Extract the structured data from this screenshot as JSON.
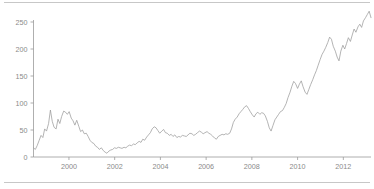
{
  "figure": {
    "background_color": "#ffffff",
    "width": 374,
    "height": 189,
    "top_rule_color": "#b9b9b9",
    "bottom_rule_color": "#b9b9b9"
  },
  "chart_data": {
    "type": "line",
    "title": "",
    "subtitle": "",
    "xlabel": "",
    "ylabel": "",
    "xlim": [
      1998.4,
      1998.4
    ],
    "ylim": [
      0,
      275
    ],
    "grid": false,
    "legend": null,
    "legend_position": "none",
    "axis_color": "#9a9a9a",
    "line_color": "#9b9b9b",
    "line_width": 0.75,
    "yticks": [
      0,
      50,
      100,
      150,
      200,
      250
    ],
    "ytick_labels": [
      "0",
      "50",
      "100",
      "150",
      "200",
      "250"
    ],
    "xticks": [
      2000,
      2002,
      2004,
      2006,
      2008,
      2010,
      2012
    ],
    "xtick_labels": [
      "2000",
      "2002",
      "2004",
      "2006",
      "2008",
      "2010",
      "2012"
    ],
    "x_start": 1998.45,
    "x_end": 1998.45,
    "series": [
      {
        "name": "value",
        "x": [
          1998.45,
          1998.53,
          1998.61,
          1998.69,
          1998.78,
          1998.86,
          1998.94,
          1999.02,
          1999.11,
          1999.19,
          1999.27,
          1999.35,
          1999.44,
          1999.52,
          1999.6,
          1999.68,
          1999.77,
          1999.85,
          1999.93,
          2000.01,
          2000.1,
          2000.18,
          2000.26,
          2000.34,
          2000.43,
          2000.51,
          2000.59,
          2000.67,
          2000.76,
          2000.84,
          2000.92,
          2001.0,
          2001.09,
          2001.17,
          2001.25,
          2001.33,
          2001.42,
          2001.5,
          2001.58,
          2001.66,
          2001.75,
          2001.83,
          2001.91,
          2001.99,
          2002.08,
          2002.16,
          2002.24,
          2002.32,
          2002.41,
          2002.49,
          2002.57,
          2002.65,
          2002.74,
          2002.82,
          2002.9,
          2002.98,
          2003.07,
          2003.15,
          2003.23,
          2003.31,
          2003.4,
          2003.48,
          2003.56,
          2003.64,
          2003.73,
          2003.81,
          2003.89,
          2003.97,
          2004.06,
          2004.14,
          2004.22,
          2004.3,
          2004.39,
          2004.47,
          2004.55,
          2004.63,
          2004.72,
          2004.8,
          2004.88,
          2004.96,
          2005.05,
          2005.13,
          2005.21,
          2005.29,
          2005.38,
          2005.46,
          2005.54,
          2005.62,
          2005.71,
          2005.79,
          2005.87,
          2005.95,
          2006.04,
          2006.12,
          2006.2,
          2006.28,
          2006.37,
          2006.45,
          2006.53,
          2006.61,
          2006.7,
          2006.78,
          2006.86,
          2006.94,
          2007.03,
          2007.11,
          2007.19,
          2007.27,
          2007.36,
          2007.44,
          2007.52,
          2007.6,
          2007.69,
          2007.77,
          2007.85,
          2007.93,
          2008.02,
          2008.1,
          2008.18,
          2008.26,
          2008.35,
          2008.43,
          2008.51,
          2008.59,
          2008.68,
          2008.76,
          2008.84,
          2008.92,
          2009.01,
          2009.09,
          2009.17,
          2009.25,
          2009.34,
          2009.42,
          2009.5,
          2009.58,
          2009.67,
          2009.75,
          2009.83,
          2009.91,
          2010.0,
          2010.08,
          2010.16,
          2010.24,
          2010.33,
          2010.41,
          2010.49,
          2010.57,
          2010.66,
          2010.74,
          2010.82,
          2010.9,
          2010.99,
          2011.07,
          2011.15,
          2011.23,
          2011.32,
          2011.4,
          2011.48,
          2011.56,
          2011.65,
          2011.73,
          2011.81,
          2011.89,
          2011.98,
          2012.06,
          2012.14,
          2012.22,
          2012.31,
          2012.39,
          2012.47,
          2012.55,
          2012.64,
          2012.72,
          2012.8,
          2012.88,
          2012.97,
          2013.05,
          2013.13,
          2013.21
        ],
        "values": [
          17,
          14,
          21,
          30,
          40,
          36,
          52,
          48,
          62,
          87,
          66,
          55,
          52,
          70,
          62,
          75,
          85,
          83,
          79,
          84,
          72,
          67,
          59,
          68,
          57,
          47,
          50,
          43,
          44,
          38,
          31,
          27,
          25,
          20,
          18,
          14,
          17,
          12,
          9,
          7,
          11,
          13,
          14,
          17,
          16,
          18,
          17,
          16,
          18,
          17,
          20,
          22,
          21,
          24,
          23,
          26,
          29,
          27,
          33,
          31,
          37,
          41,
          45,
          52,
          56,
          54,
          49,
          44,
          48,
          51,
          45,
          44,
          40,
          42,
          38,
          41,
          36,
          38,
          37,
          40,
          39,
          38,
          41,
          44,
          43,
          40,
          42,
          45,
          48,
          46,
          43,
          45,
          47,
          44,
          42,
          39,
          35,
          33,
          38,
          40,
          42,
          41,
          43,
          42,
          44,
          52,
          64,
          70,
          74,
          80,
          84,
          88,
          93,
          95,
          90,
          84,
          78,
          74,
          80,
          83,
          79,
          82,
          81,
          76,
          66,
          54,
          48,
          58,
          69,
          74,
          79,
          84,
          86,
          92,
          99,
          110,
          120,
          131,
          140,
          136,
          127,
          135,
          141,
          130,
          120,
          116,
          125,
          134,
          143,
          152,
          160,
          170,
          181,
          190,
          196,
          203,
          212,
          222,
          218,
          205,
          196,
          185,
          178,
          196,
          207,
          200,
          210,
          221,
          214,
          226,
          237,
          231,
          241,
          246,
          240,
          252,
          258,
          264,
          270,
          258
        ]
      }
    ]
  }
}
